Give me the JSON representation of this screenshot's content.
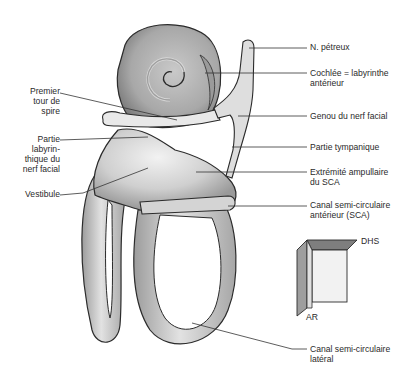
{
  "diagram": {
    "labels_left": [
      {
        "id": "premier-tour-de-spire",
        "lines": [
          "Premier",
          "tour de",
          "spire"
        ]
      },
      {
        "id": "partie-labyrinthique",
        "lines": [
          "Partie",
          "labyrin-",
          "thique du",
          "nerf facial"
        ]
      },
      {
        "id": "vestibule",
        "lines": [
          "Vestibule"
        ]
      }
    ],
    "labels_right": [
      {
        "id": "n-petreux",
        "lines": [
          "N. pétreux"
        ]
      },
      {
        "id": "cochlee",
        "lines": [
          "Cochlée = labyrinthe",
          "antérieur"
        ]
      },
      {
        "id": "genou-nerf-facial",
        "lines": [
          "Genou du nerf facial"
        ]
      },
      {
        "id": "partie-tympanique",
        "lines": [
          "Partie tympanique"
        ]
      },
      {
        "id": "extremite-ampullaire",
        "lines": [
          "Extrémité ampullaire",
          "du SCA"
        ]
      },
      {
        "id": "canal-sca",
        "lines": [
          "Canal semi-circulaire",
          "antérieur (SCA)"
        ]
      },
      {
        "id": "canal-lateral",
        "lines": [
          "Canal semi-circulaire",
          "latéral"
        ]
      }
    ],
    "orientation": {
      "top_right": "DHS",
      "bottom_left": "AR"
    },
    "colors": {
      "outline": "#2b2b2b",
      "fill_light": "#e4e4e4",
      "fill_mid": "#bdbdbd",
      "fill_dark": "#8c8c8c",
      "leader": "#333333"
    }
  }
}
